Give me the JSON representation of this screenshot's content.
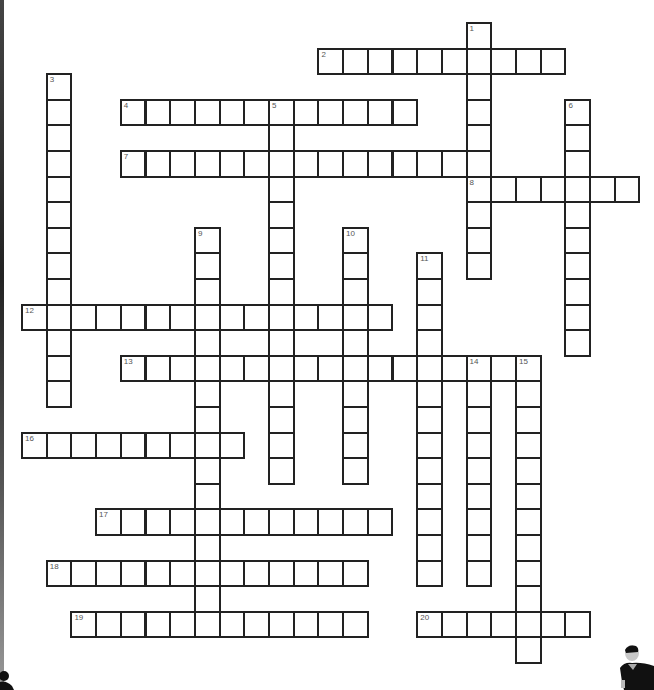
{
  "puzzle": {
    "type": "crossword",
    "grid": {
      "origin_x": 21,
      "origin_y": 22,
      "cell_w": 24.7,
      "cell_h": 25.6
    },
    "words": [
      {
        "number": "1",
        "dir": "down",
        "col": 18,
        "row": 0,
        "len": 10
      },
      {
        "number": "2",
        "dir": "across",
        "col": 12,
        "row": 1,
        "len": 10
      },
      {
        "number": "3",
        "dir": "down",
        "col": 1,
        "row": 2,
        "len": 13
      },
      {
        "number": "4",
        "dir": "across",
        "col": 4,
        "row": 3,
        "len": 12
      },
      {
        "number": "5",
        "dir": "down",
        "col": 10,
        "row": 3,
        "len": 15
      },
      {
        "number": "6",
        "dir": "down",
        "col": 22,
        "row": 3,
        "len": 10
      },
      {
        "number": "7",
        "dir": "across",
        "col": 4,
        "row": 5,
        "len": 15
      },
      {
        "number": "8",
        "dir": "across",
        "col": 18,
        "row": 6,
        "len": 7
      },
      {
        "number": "9",
        "dir": "down",
        "col": 7,
        "row": 8,
        "len": 15
      },
      {
        "number": "10",
        "dir": "down",
        "col": 13,
        "row": 8,
        "len": 10
      },
      {
        "number": "11",
        "dir": "down",
        "col": 16,
        "row": 9,
        "len": 13
      },
      {
        "number": "12",
        "dir": "across",
        "col": 0,
        "row": 11,
        "len": 15
      },
      {
        "number": "13",
        "dir": "across",
        "col": 4,
        "row": 13,
        "len": 17
      },
      {
        "number": "14",
        "dir": "down",
        "col": 18,
        "row": 13,
        "len": 9
      },
      {
        "number": "15",
        "dir": "down",
        "col": 20,
        "row": 13,
        "len": 12
      },
      {
        "number": "16",
        "dir": "across",
        "col": 0,
        "row": 16,
        "len": 9
      },
      {
        "number": "17",
        "dir": "across",
        "col": 3,
        "row": 19,
        "len": 12
      },
      {
        "number": "18",
        "dir": "across",
        "col": 1,
        "row": 21,
        "len": 13
      },
      {
        "number": "19",
        "dir": "across",
        "col": 2,
        "row": 23,
        "len": 12
      },
      {
        "number": "20",
        "dir": "across",
        "col": 16,
        "row": 23,
        "len": 7
      }
    ]
  },
  "decorations": {
    "bottom_left_figure": "person-silhouette-icon",
    "bottom_right_figure": "person-silhouette-icon"
  }
}
